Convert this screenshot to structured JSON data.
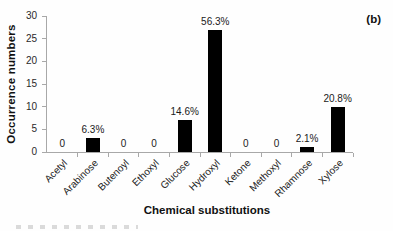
{
  "panel_label": "(b)",
  "chart_data": {
    "type": "bar",
    "title": "",
    "xlabel": "Chemical substitutions",
    "ylabel": "Occurrence numbers",
    "ylim": [
      0,
      30
    ],
    "yticks": [
      0,
      5,
      10,
      15,
      20,
      25,
      30
    ],
    "categories": [
      "Acetyl",
      "Arabinose",
      "Butenoyl",
      "Ethoxyl",
      "Glucose",
      "Hydroxyl",
      "Ketone",
      "Methoxyl",
      "Rhamnose",
      "Xylose"
    ],
    "values": [
      0,
      3,
      0,
      0,
      7,
      27,
      0,
      0,
      1,
      10
    ],
    "bar_labels": [
      "0",
      "6.3%",
      "0",
      "0",
      "14.6%",
      "56.3%",
      "0",
      "0",
      "2.1%",
      "20.8%"
    ],
    "bar_color": "#000000",
    "axis_color": "#a8a8a8",
    "text_color": "#1c1c1c",
    "background": "#fefefe",
    "grid": false,
    "legend": null
  }
}
